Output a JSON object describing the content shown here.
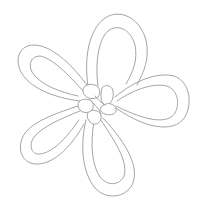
{
  "image": {
    "subject": "knotted flower line drawing",
    "petal_count": 5,
    "background_color": "#ffffff",
    "line_color": "#9a9a9a"
  }
}
